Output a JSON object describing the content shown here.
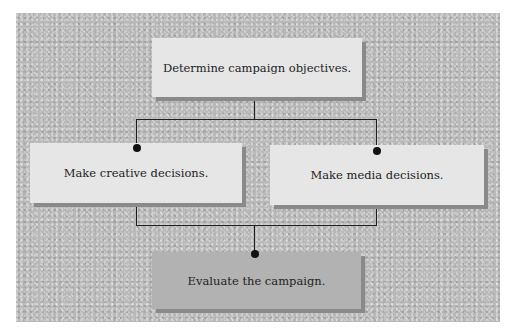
{
  "diagram": {
    "type": "flowchart",
    "colors": {
      "background_panel": "#b9b9b9",
      "box_light": "#e6e6e6",
      "box_dark": "#b2b2b2",
      "shadow": "#8a8a8a",
      "line": "#1e1e1e",
      "text": "#222222"
    },
    "nodes": [
      {
        "id": "objectives",
        "label": "Determine campaign objectives."
      },
      {
        "id": "creative",
        "label": "Make creative decisions."
      },
      {
        "id": "media",
        "label": "Make media decisions."
      },
      {
        "id": "evaluate",
        "label": "Evaluate the campaign."
      }
    ],
    "edges": [
      {
        "from": "objectives",
        "to": "creative"
      },
      {
        "from": "objectives",
        "to": "media"
      },
      {
        "from": "creative",
        "to": "evaluate"
      },
      {
        "from": "media",
        "to": "evaluate"
      }
    ]
  }
}
